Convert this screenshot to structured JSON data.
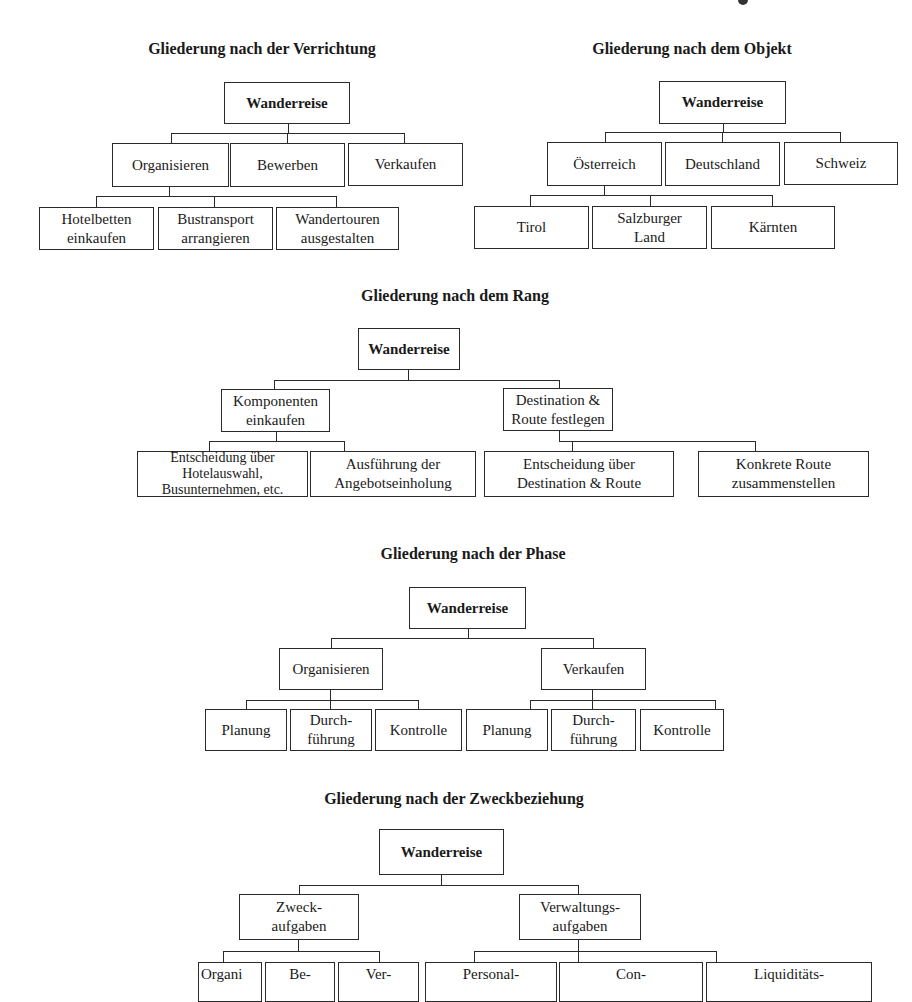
{
  "page": {
    "top_fragment": "g",
    "sections": [
      {
        "id": "verrichtung",
        "title": "Gliederung nach der Verrichtung",
        "root": "Wanderreise",
        "level1": [
          "Organisieren",
          "Bewerben",
          "Verkaufen"
        ],
        "level2_parent": "Organisieren",
        "level2": [
          "Hotelbetten\neinkaufen",
          "Bustransport\narrangieren",
          "Wandertouren\nausgestalten"
        ]
      },
      {
        "id": "objekt",
        "title": "Gliederung nach dem Objekt",
        "root": "Wanderreise",
        "level1": [
          "Österreich",
          "Deutschland",
          "Schweiz"
        ],
        "level2_parent": "Österreich",
        "level2": [
          "Tirol",
          "Salzburger\nLand",
          "Kärnten"
        ]
      },
      {
        "id": "rang",
        "title": "Gliederung nach dem Rang",
        "root": "Wanderreise",
        "level1": [
          "Komponenten\neinkaufen",
          "Destination &\nRoute festlegen"
        ],
        "level2": [
          [
            "Entscheidung über\nHotelauswahl,\nBusunternehmen, etc.",
            "Ausführung der\nAngebotseinholung"
          ],
          [
            "Entscheidung über\nDestination & Route",
            "Konkrete Route\nzusammenstellen"
          ]
        ]
      },
      {
        "id": "phase",
        "title": "Gliederung nach der Phase",
        "root": "Wanderreise",
        "level1": [
          "Organisieren",
          "Verkaufen"
        ],
        "level2": [
          [
            "Planung",
            "Durch-\nführung",
            "Kontrolle"
          ],
          [
            "Planung",
            "Durch-\nführung",
            "Kontrolle"
          ]
        ]
      },
      {
        "id": "zweckbeziehung",
        "title": "Gliederung nach der Zweckbeziehung",
        "root": "Wanderreise",
        "level1": [
          "Zweck-\naufgaben",
          "Verwaltungs-\naufgaben"
        ],
        "level2": [
          [
            "Organi",
            "Be-",
            "Ver-"
          ],
          [
            "Personal-",
            "Con-",
            "Liquiditäts-"
          ]
        ]
      }
    ]
  },
  "colors": {
    "line": "#2a2a2a",
    "text": "#1a1a1a",
    "background": "#ffffff"
  }
}
